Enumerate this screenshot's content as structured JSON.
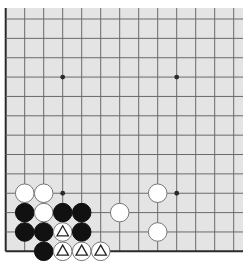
{
  "board": {
    "view": "partial-diagram",
    "columns_visible": 13,
    "rows_visible": 13,
    "edges_shown": [
      "left",
      "bottom"
    ],
    "colors": {
      "board_background": "#e4e4e4",
      "grid_line": "#6a6a6a",
      "edge_line": "#2a2a2a",
      "black_stone": "#111111",
      "white_stone": "#ffffff",
      "white_stone_border": "#777777",
      "marker": "#222222"
    },
    "star_points": [
      {
        "col": 3,
        "row": 3
      },
      {
        "col": 9,
        "row": 3
      },
      {
        "col": 3,
        "row": 9
      },
      {
        "col": 9,
        "row": 9
      }
    ],
    "stones": [
      {
        "color": "white",
        "col": 1,
        "row": 9,
        "marker": ""
      },
      {
        "color": "white",
        "col": 2,
        "row": 9,
        "marker": ""
      },
      {
        "color": "white",
        "col": 8,
        "row": 9,
        "marker": ""
      },
      {
        "color": "black",
        "col": 1,
        "row": 10,
        "marker": ""
      },
      {
        "color": "white",
        "col": 2,
        "row": 10,
        "marker": ""
      },
      {
        "color": "black",
        "col": 3,
        "row": 10,
        "marker": ""
      },
      {
        "color": "black",
        "col": 4,
        "row": 10,
        "marker": ""
      },
      {
        "color": "white",
        "col": 6,
        "row": 10,
        "marker": ""
      },
      {
        "color": "black",
        "col": 1,
        "row": 11,
        "marker": ""
      },
      {
        "color": "black",
        "col": 2,
        "row": 11,
        "marker": ""
      },
      {
        "color": "white",
        "col": 3,
        "row": 11,
        "marker": "triangle"
      },
      {
        "color": "black",
        "col": 4,
        "row": 11,
        "marker": ""
      },
      {
        "color": "white",
        "col": 8,
        "row": 11,
        "marker": ""
      },
      {
        "color": "black",
        "col": 2,
        "row": 12,
        "marker": ""
      },
      {
        "color": "white",
        "col": 3,
        "row": 12,
        "marker": "triangle"
      },
      {
        "color": "white",
        "col": 4,
        "row": 12,
        "marker": "triangle"
      },
      {
        "color": "white",
        "col": 5,
        "row": 12,
        "marker": "triangle"
      }
    ]
  }
}
